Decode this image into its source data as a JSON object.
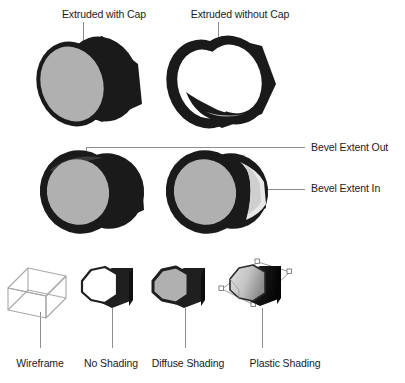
{
  "figure": {
    "background_color": "#ffffff",
    "ink_color": "#1a1a1a",
    "cap_gray": "#b0b0b0",
    "leader_color": "#8d8d8d",
    "sections": [
      {
        "name": "extrusion-row",
        "labels": [
          "Extruded with Cap",
          "Extruded without Cap"
        ]
      },
      {
        "name": "bevel-row",
        "labels": [
          "Bevel Extent Out",
          "Bevel Extent In"
        ]
      },
      {
        "name": "shading-row",
        "labels": [
          "Wireframe",
          "No Shading",
          "Diffuse Shading",
          "Plastic Shading"
        ]
      }
    ]
  },
  "extrusion": {
    "with_cap": {
      "label": "Extruded with Cap",
      "label_x": 104,
      "label_y": 8,
      "cap_color": "#b0b0b0",
      "body_color": "#1a1a1a"
    },
    "without_cap": {
      "label": "Extruded without Cap",
      "label_x": 240,
      "label_y": 8,
      "interior_color": "#ffffff",
      "body_color": "#1a1a1a"
    }
  },
  "bevel": {
    "extent_out": {
      "label": "Bevel Extent Out",
      "label_x": 311,
      "label_y": 141
    },
    "extent_in": {
      "label": "Bevel Extent In",
      "label_x": 311,
      "label_y": 182
    }
  },
  "shading": {
    "items": [
      {
        "label": "Wireframe",
        "label_x": 40,
        "label_y": 358,
        "style": "wireframe",
        "face_color": "none"
      },
      {
        "label": "No Shading",
        "label_x": 104,
        "label_y": 358,
        "style": "flat",
        "face_color": "#ffffff"
      },
      {
        "label": "Diffuse Shading",
        "label_x": 180,
        "label_y": 358,
        "style": "diffuse",
        "face_color": "#b0b0b0"
      },
      {
        "label": "Plastic Shading",
        "label_x": 283,
        "label_y": 358,
        "style": "plastic",
        "face_color": "#cfcfcf",
        "selected": true
      }
    ]
  }
}
